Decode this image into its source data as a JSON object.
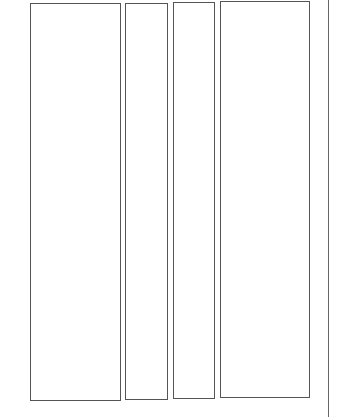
{
  "diagram": {
    "background": "#ffffff",
    "stroke_color": "#555555",
    "panels": [
      {
        "id": "panel-1",
        "x": 30,
        "y": 3,
        "w": 91,
        "h": 398
      },
      {
        "id": "panel-2",
        "x": 125,
        "y": 3,
        "w": 43,
        "h": 397
      },
      {
        "id": "panel-3",
        "x": 173,
        "y": 2,
        "w": 42,
        "h": 397
      },
      {
        "id": "panel-4",
        "x": 220,
        "y": 1,
        "w": 90,
        "h": 397
      }
    ],
    "divider_line": {
      "x": 328,
      "y1": 0,
      "y2": 417
    }
  }
}
